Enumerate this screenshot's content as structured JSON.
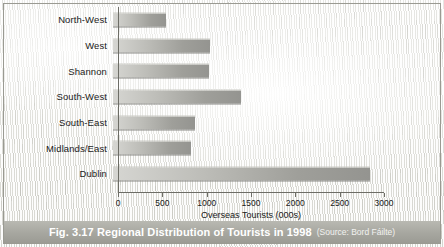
{
  "figure": {
    "caption_main": "Fig. 3.17 Regional Distribution of Tourists in 1998",
    "caption_source": "(Source: Bord Fáilte)",
    "background": "grass-texture",
    "caption_bar_color": "#a8a8a1",
    "bar_color": "#9f9f9a",
    "axis_color": "#6d6d66"
  },
  "chart_data": {
    "type": "bar",
    "orientation": "horizontal",
    "title": "Fig. 3.17 Regional Distribution of Tourists in 1998",
    "subtitle": "(Source: Bord Fáilte)",
    "categories": [
      "North-West",
      "West",
      "Shannon",
      "South-West",
      "South-East",
      "Midlands/East",
      "Dublin"
    ],
    "values": [
      600,
      1090,
      1080,
      1440,
      930,
      880,
      2900
    ],
    "xlabel": "Overseas Tourists (000s)",
    "ylabel": "",
    "xlim": [
      0,
      3000
    ],
    "xticks": [
      0,
      500,
      1000,
      1500,
      2000,
      2500,
      3000
    ],
    "xtick_labels": [
      "0",
      "500",
      "1000",
      "1500",
      "2000",
      "2500",
      "3000"
    ],
    "grid": false,
    "legend": false
  }
}
